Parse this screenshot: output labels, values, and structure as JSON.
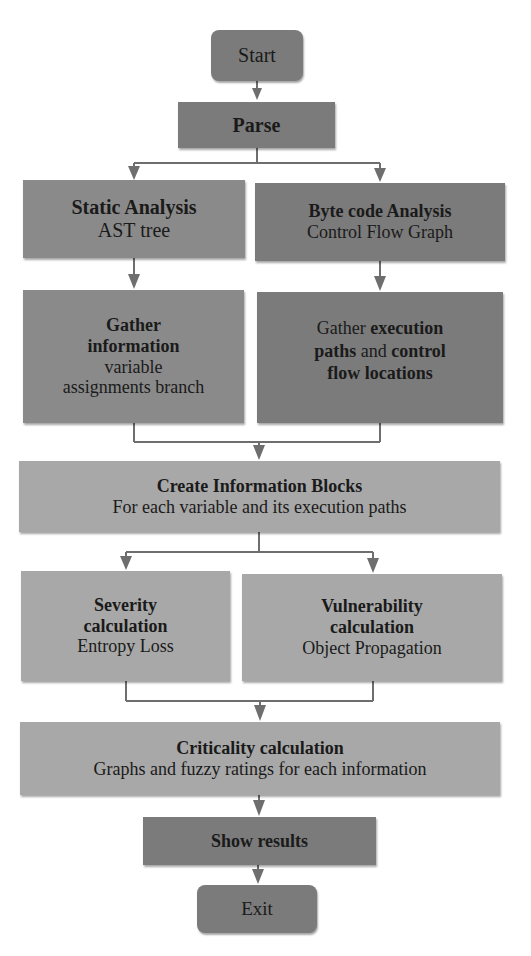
{
  "diagram": {
    "type": "flowchart",
    "colors": {
      "terminal_fill": "#7b7b7b",
      "process_dark_fill": "#7b7b7b",
      "process_light_fill": "#a8a8a8",
      "connector": "#6e6e6e",
      "text": "#1a1a1a"
    },
    "nodes": {
      "start": {
        "label": "Start"
      },
      "parse": {
        "label": "Parse"
      },
      "static_analysis": {
        "title": "Static Analysis",
        "subtitle": "AST tree"
      },
      "bytecode_analysis": {
        "title": "Byte code Analysis",
        "subtitle": "Control Flow Graph"
      },
      "gather_info_left": {
        "title_line1": "Gather",
        "title_line2": "information",
        "body_line1": "variable",
        "body_line2": "assignments branch"
      },
      "gather_info_right": {
        "line1_plain": "Gather ",
        "line1_bold": "execution",
        "line2_bold_a": "paths",
        "line2_plain": " and ",
        "line2_bold_b": "control",
        "line3_bold": "flow locations"
      },
      "create_info_blocks": {
        "title": "Create Information Blocks",
        "subtitle": "For each variable and its execution paths"
      },
      "severity": {
        "title_line1": "Severity",
        "title_line2": "calculation",
        "subtitle": "Entropy Loss"
      },
      "vulnerability": {
        "title_line1": "Vulnerability",
        "title_line2": "calculation",
        "subtitle": "Object Propagation"
      },
      "criticality": {
        "title": "Criticality calculation",
        "subtitle": "Graphs and fuzzy ratings for each information"
      },
      "show_results": {
        "label": "Show results"
      },
      "exit": {
        "label": "Exit"
      }
    },
    "edges": [
      [
        "start",
        "parse"
      ],
      [
        "parse",
        "static_analysis"
      ],
      [
        "parse",
        "bytecode_analysis"
      ],
      [
        "static_analysis",
        "gather_info_left"
      ],
      [
        "bytecode_analysis",
        "gather_info_right"
      ],
      [
        "gather_info_left",
        "create_info_blocks"
      ],
      [
        "gather_info_right",
        "create_info_blocks"
      ],
      [
        "create_info_blocks",
        "severity"
      ],
      [
        "create_info_blocks",
        "vulnerability"
      ],
      [
        "severity",
        "criticality"
      ],
      [
        "vulnerability",
        "criticality"
      ],
      [
        "criticality",
        "show_results"
      ],
      [
        "show_results",
        "exit"
      ]
    ]
  }
}
